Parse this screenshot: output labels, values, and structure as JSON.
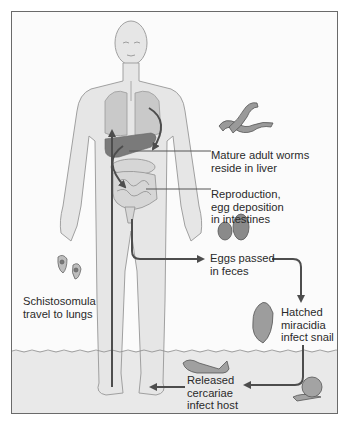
{
  "diagram": {
    "colors": {
      "frame": "#6a6a6a",
      "body_fill": "#e6e6e6",
      "body_outline": "#9a9a9a",
      "organ": "#c9c9c9",
      "liver": "#7a7a7a",
      "arrow": "#4d4d4d",
      "water": "#e9e9e9"
    },
    "stages": [
      {
        "id": "adult-worms",
        "lines": [
          "Mature adult worms",
          "reside in liver"
        ],
        "icon": "worm-pair-icon"
      },
      {
        "id": "reproduction",
        "lines": [
          "Reproduction,",
          "egg deposition",
          "in intestines"
        ],
        "icon": "intestines-icon"
      },
      {
        "id": "eggs",
        "lines": [
          "Eggs passed",
          "in feces"
        ],
        "icon": "egg-icon"
      },
      {
        "id": "miracidia",
        "lines": [
          "Hatched",
          "miracidia",
          "infect snail"
        ],
        "icon": "miracidium-icon"
      },
      {
        "id": "cercariae",
        "lines": [
          "Released",
          "cercariae",
          "infect host"
        ],
        "icon": "cercaria-icon"
      },
      {
        "id": "schistosomula",
        "lines": [
          "Schistosomula",
          "travel to lungs"
        ],
        "icon": "schistosomulum-icon"
      }
    ]
  }
}
